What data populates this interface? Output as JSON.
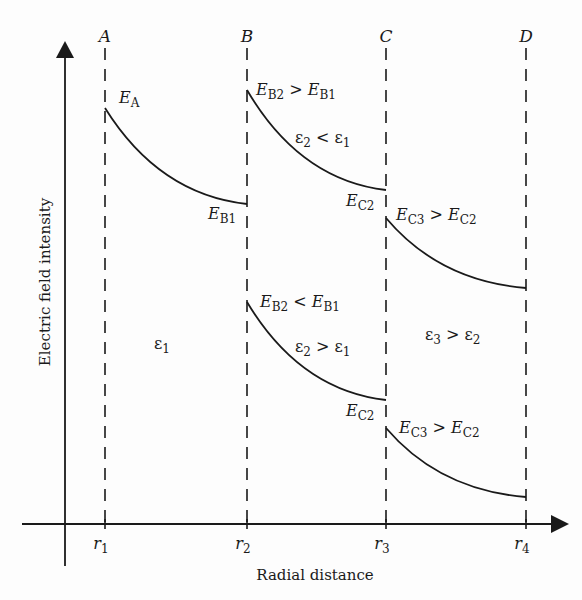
{
  "figure": {
    "y_axis_label": "Electric field intensity",
    "x_axis_label": "Radial distance",
    "stroke_color": "#1a1a1a",
    "boundaries": [
      {
        "name": "A",
        "r": "r",
        "sub": "1",
        "x": 105
      },
      {
        "name": "B",
        "r": "r",
        "sub": "2",
        "x": 247
      },
      {
        "name": "C",
        "r": "r",
        "sub": "3",
        "x": 386
      },
      {
        "name": "D",
        "r": "r",
        "sub": "4",
        "x": 526
      }
    ],
    "curves": [
      {
        "id": "region1",
        "x1": 105,
        "y1": 108,
        "x2": 247,
        "y2": 204
      },
      {
        "id": "region2-upper",
        "x1": 247,
        "y1": 90,
        "x2": 386,
        "y2": 190
      },
      {
        "id": "region3-upper",
        "x1": 386,
        "y1": 218,
        "x2": 526,
        "y2": 288
      },
      {
        "id": "region2-lower",
        "x1": 247,
        "y1": 302,
        "x2": 386,
        "y2": 400
      },
      {
        "id": "region3-lower",
        "x1": 386,
        "y1": 428,
        "x2": 526,
        "y2": 497
      }
    ],
    "labels": {
      "E_A": {
        "main": "E",
        "sub": "A"
      },
      "E_B1": {
        "main": "E",
        "sub": "B1"
      },
      "upper_B_relation": {
        "l": "E",
        "lsub": "B2",
        "op": ">",
        "r": "E",
        "rsub": "B1"
      },
      "upper_eps_relation": {
        "l": "ε",
        "lsub": "2",
        "op": "<",
        "r": "ε",
        "rsub": "1"
      },
      "upper_E_C2": {
        "main": "E",
        "sub": "C2"
      },
      "upper_C_relation": {
        "l": "E",
        "lsub": "C3",
        "op": ">",
        "r": "E",
        "rsub": "C2"
      },
      "eps1": {
        "main": "ε",
        "sub": "1"
      },
      "lower_B_relation": {
        "l": "E",
        "lsub": "B2",
        "op": "<",
        "r": "E",
        "rsub": "B1"
      },
      "lower_eps_relation": {
        "l": "ε",
        "lsub": "2",
        "op": ">",
        "r": "ε",
        "rsub": "1"
      },
      "eps3_relation": {
        "l": "ε",
        "lsub": "3",
        "op": ">",
        "r": "ε",
        "rsub": "2"
      },
      "lower_E_C2": {
        "main": "E",
        "sub": "C2"
      },
      "lower_C_relation": {
        "l": "E",
        "lsub": "C3",
        "op": ">",
        "r": "E",
        "rsub": "C2"
      }
    }
  }
}
